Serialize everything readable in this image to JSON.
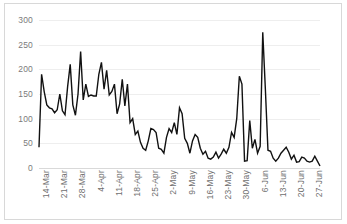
{
  "chart_data": {
    "type": "line",
    "title": "",
    "subtitle": "",
    "xlabel": "",
    "ylabel": "",
    "ylim": [
      0,
      300
    ],
    "ytick_labels": [
      "300",
      "250",
      "200",
      "150",
      "100",
      "50",
      "0"
    ],
    "ytick_values": [
      300,
      250,
      200,
      150,
      100,
      50,
      0
    ],
    "grid": true,
    "grid_axis": "y",
    "legend": false,
    "legend_position": "none",
    "line_color": "#111111",
    "grid_color": "#eeeeee",
    "axis_label_color": "#7b7b7b",
    "xtick_labels": [
      "14-Mar",
      "21-Mar",
      "28-Mar",
      "4-Apr",
      "11-Apr",
      "18-Apr",
      "25-Apr",
      "2-May",
      "9-May",
      "16-May",
      "23-May",
      "30-May",
      "6-Jun",
      "13-Jun",
      "20-Jun",
      "27-Jun"
    ],
    "xtick_indices": [
      0,
      7,
      14,
      21,
      28,
      35,
      42,
      49,
      56,
      63,
      70,
      77,
      84,
      91,
      98,
      105
    ],
    "x_start_label": "14-Mar",
    "x_end_label": "30-Jun",
    "x": [
      "14-Mar",
      "15-Mar",
      "16-Mar",
      "17-Mar",
      "18-Mar",
      "19-Mar",
      "20-Mar",
      "21-Mar",
      "22-Mar",
      "23-Mar",
      "24-Mar",
      "25-Mar",
      "26-Mar",
      "27-Mar",
      "28-Mar",
      "29-Mar",
      "30-Mar",
      "31-Mar",
      "1-Apr",
      "2-Apr",
      "3-Apr",
      "4-Apr",
      "5-Apr",
      "6-Apr",
      "7-Apr",
      "8-Apr",
      "9-Apr",
      "10-Apr",
      "11-Apr",
      "12-Apr",
      "13-Apr",
      "14-Apr",
      "15-Apr",
      "16-Apr",
      "17-Apr",
      "18-Apr",
      "19-Apr",
      "20-Apr",
      "21-Apr",
      "22-Apr",
      "23-Apr",
      "24-Apr",
      "25-Apr",
      "26-Apr",
      "27-Apr",
      "28-Apr",
      "29-Apr",
      "30-Apr",
      "1-May",
      "2-May",
      "3-May",
      "4-May",
      "5-May",
      "6-May",
      "7-May",
      "8-May",
      "9-May",
      "10-May",
      "11-May",
      "12-May",
      "13-May",
      "14-May",
      "15-May",
      "16-May",
      "17-May",
      "18-May",
      "19-May",
      "20-May",
      "21-May",
      "22-May",
      "23-May",
      "24-May",
      "25-May",
      "26-May",
      "27-May",
      "28-May",
      "29-May",
      "30-May",
      "31-May",
      "1-Jun",
      "2-Jun",
      "3-Jun",
      "4-Jun",
      "5-Jun",
      "6-Jun",
      "7-Jun",
      "8-Jun",
      "9-Jun",
      "10-Jun",
      "11-Jun",
      "12-Jun",
      "13-Jun",
      "14-Jun",
      "15-Jun",
      "16-Jun",
      "17-Jun",
      "18-Jun",
      "19-Jun",
      "20-Jun",
      "21-Jun",
      "22-Jun",
      "23-Jun",
      "24-Jun",
      "25-Jun",
      "26-Jun",
      "27-Jun",
      "28-Jun",
      "29-Jun",
      "30-Jun"
    ],
    "values": [
      42,
      190,
      155,
      128,
      122,
      120,
      112,
      118,
      150,
      116,
      108,
      165,
      210,
      128,
      107,
      150,
      236,
      138,
      170,
      145,
      148,
      146,
      146,
      190,
      214,
      160,
      198,
      148,
      155,
      170,
      110,
      130,
      180,
      126,
      170,
      92,
      100,
      68,
      75,
      52,
      40,
      36,
      55,
      80,
      78,
      72,
      40,
      38,
      30,
      62,
      80,
      72,
      92,
      68,
      122,
      110,
      60,
      50,
      30,
      55,
      68,
      62,
      40,
      28,
      34,
      20,
      18,
      22,
      32,
      20,
      28,
      38,
      30,
      42,
      72,
      62,
      100,
      186,
      170,
      14,
      15,
      96,
      40,
      58,
      30,
      44,
      275,
      160,
      36,
      34,
      20,
      14,
      20,
      30,
      36,
      42,
      32,
      18,
      26,
      12,
      13,
      22,
      20,
      14,
      12,
      14,
      24,
      14,
      4
    ]
  }
}
